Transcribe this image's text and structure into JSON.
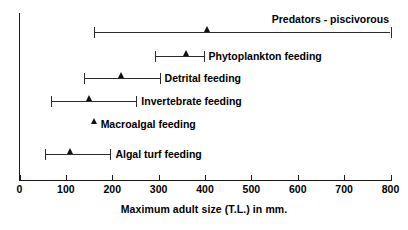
{
  "chart_data": {
    "type": "bar",
    "title": "",
    "xlabel": "Maximum adult size (T.L.) in mm.",
    "ylabel": "",
    "xlim": [
      0,
      800
    ],
    "xticks": [
      0,
      100,
      200,
      300,
      400,
      500,
      600,
      700,
      800
    ],
    "xtick_labels": [
      "0",
      "100",
      "200",
      "300",
      "400",
      "500",
      "600",
      "700",
      "800"
    ],
    "grid": false,
    "legend": "none",
    "orientation": "horizontal",
    "marker_symbol": "triangle-up",
    "note": "Horizontal range bars with end caps; triangle marker indicates mean/typical maximum adult size.",
    "categories": [
      "Predators - piscivorous",
      "Phytoplankton feeding",
      "Detrital feeding",
      "Invertebrate feeding",
      "Macroalgal feeding",
      "Algal turf feeding"
    ],
    "series": [
      {
        "name": "Predators - piscivorous",
        "label": "Predators - piscivorous",
        "label_position": "above",
        "min": 160,
        "max": 800,
        "marker": 405,
        "has_range": true
      },
      {
        "name": "Phytoplankton feeding",
        "label": "Phytoplankton feeding",
        "label_position": "right",
        "min": 293,
        "max": 397,
        "marker": 360,
        "has_range": true
      },
      {
        "name": "Detrital feeding",
        "label": "Detrital feeding",
        "label_position": "right",
        "min": 140,
        "max": 302,
        "marker": 220,
        "has_range": true
      },
      {
        "name": "Invertebrate feeding",
        "label": "Invertebrate feeding",
        "label_position": "right",
        "min": 67,
        "max": 252,
        "marker": 150,
        "has_range": true
      },
      {
        "name": "Macroalgal feeding",
        "label": "Macroalgal feeding",
        "label_position": "right",
        "min": null,
        "max": null,
        "marker": 162,
        "has_range": false
      },
      {
        "name": "Algal turf feeding",
        "label": "Algal turf feeding",
        "label_position": "right",
        "min": 55,
        "max": 196,
        "marker": 110,
        "has_range": true
      }
    ],
    "colors": {
      "axis": "#1a1a1a",
      "line": "#2b2b2b",
      "marker": "#111111",
      "text": "#000000",
      "background": "#ffffff"
    }
  }
}
